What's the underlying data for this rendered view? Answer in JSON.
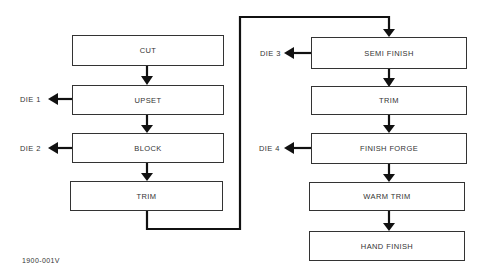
{
  "diagram": {
    "left_column": [
      {
        "id": "cut",
        "label": "CUT"
      },
      {
        "id": "upset",
        "label": "UPSET",
        "die": "DIE 1"
      },
      {
        "id": "block",
        "label": "BLOCK",
        "die": "DIE 2"
      },
      {
        "id": "trim1",
        "label": "TRIM"
      }
    ],
    "right_column": [
      {
        "id": "semi_finish",
        "label": "SEMI FINISH",
        "die": "DIE 3"
      },
      {
        "id": "trim2",
        "label": "TRIM"
      },
      {
        "id": "finish_forge",
        "label": "FINISH FORGE",
        "die": "DIE 4"
      },
      {
        "id": "warm_trim",
        "label": "WARM TRIM"
      },
      {
        "id": "hand_finish",
        "label": "HAND FINISH"
      }
    ],
    "figure_id": "1900-001V",
    "line_color": "#222222"
  }
}
